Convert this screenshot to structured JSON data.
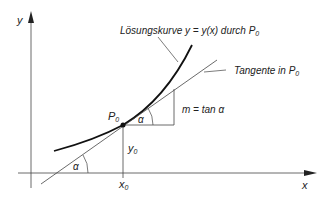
{
  "labels": {
    "y_axis": "y",
    "x_axis": "x",
    "curve": "Lösungskurve y = y(x) durch P",
    "curve_sub": "0",
    "tangent": "Tangente in P",
    "tangent_sub": "0",
    "point": "P",
    "point_sub": "0",
    "slope": "m = tan α",
    "alpha_top": "α",
    "alpha_bottom": "α",
    "y0": "y",
    "y0_sub": "0",
    "x0": "x",
    "x0_sub": "0"
  },
  "colors": {
    "ink": "#222222",
    "thin": "#444444"
  }
}
